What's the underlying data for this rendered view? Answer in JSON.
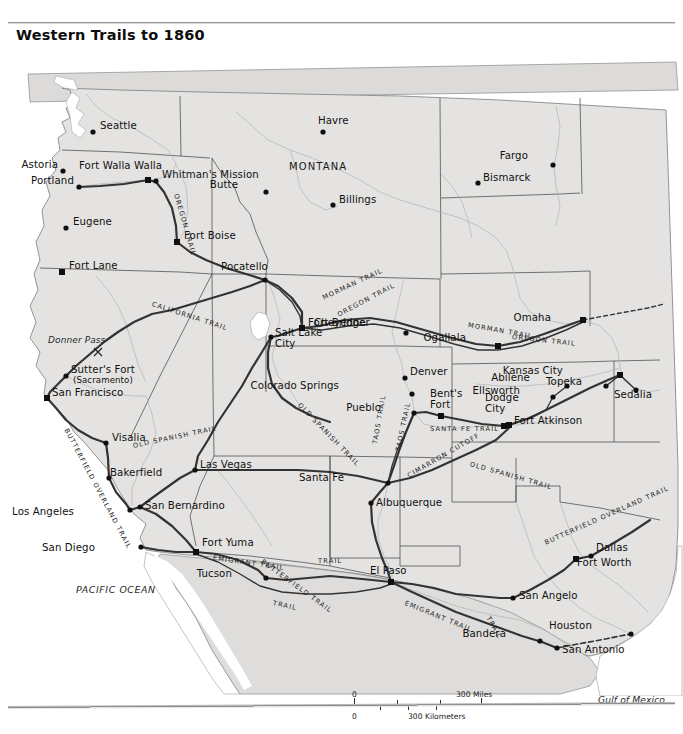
{
  "page": {
    "ghost_header": "",
    "title": "Western Trails to 1860"
  },
  "map": {
    "state_labels": [
      {
        "name": "MONTANA",
        "x": 289,
        "y": 122
      }
    ],
    "water_labels": [
      {
        "name": "PACIFIC OCEAN",
        "x": 76,
        "y": 545
      },
      {
        "name": "Gulf of Mexico",
        "x": 598,
        "y": 655
      }
    ],
    "feature_labels": [
      {
        "name": "Donner Pass",
        "x": 48,
        "y": 296
      }
    ],
    "cities": [
      {
        "name": "Seattle",
        "x": 93,
        "y": 86,
        "lx": 100,
        "ly": 81,
        "marker": "dot",
        "anchor": "left"
      },
      {
        "name": "Astoria",
        "x": 63,
        "y": 125,
        "lx": 58,
        "ly": 120,
        "marker": "dot",
        "anchor": "right"
      },
      {
        "name": "Portland",
        "x": 79,
        "y": 141,
        "lx": 74,
        "ly": 136,
        "marker": "dot",
        "anchor": "right"
      },
      {
        "name": "Fort Walla Walla",
        "x": 148,
        "y": 134,
        "lx": 79,
        "ly": 121,
        "marker": "square",
        "anchor": "left"
      },
      {
        "name": "Whitman's Mission",
        "x": 156,
        "y": 135,
        "lx": 162,
        "ly": 130,
        "marker": "dot",
        "anchor": "left"
      },
      {
        "name": "Eugene",
        "x": 66,
        "y": 182,
        "lx": 73,
        "ly": 177,
        "marker": "dot",
        "anchor": "left"
      },
      {
        "name": "Fort Boise",
        "x": 177,
        "y": 196,
        "lx": 184,
        "ly": 191,
        "marker": "square",
        "anchor": "left"
      },
      {
        "name": "Fort Lane",
        "x": 62,
        "y": 226,
        "lx": 69,
        "ly": 221,
        "marker": "square",
        "anchor": "left"
      },
      {
        "name": "Pocatello",
        "x": 265,
        "y": 234,
        "lx": 221,
        "ly": 222,
        "marker": "dot",
        "anchor": "left"
      },
      {
        "name": "Butte",
        "x": 266,
        "y": 146,
        "lx": 238,
        "ly": 140,
        "marker": "dot",
        "anchor": "right"
      },
      {
        "name": "Havre",
        "x": 323,
        "y": 86,
        "lx": 318,
        "ly": 76,
        "marker": "dot",
        "anchor": "left"
      },
      {
        "name": "Billings",
        "x": 333,
        "y": 159,
        "lx": 339,
        "ly": 155,
        "marker": "dot",
        "anchor": "left"
      },
      {
        "name": "Bismarck",
        "x": 478,
        "y": 137,
        "lx": 483,
        "ly": 133,
        "marker": "dot",
        "anchor": "left"
      },
      {
        "name": "Fargo",
        "x": 553,
        "y": 119,
        "lx": 528,
        "ly": 111,
        "marker": "dot",
        "anchor": "right"
      },
      {
        "name": "Salt Lake City",
        "x": 271,
        "y": 291,
        "lx": 275,
        "ly": 288,
        "marker": "dot",
        "anchor": "left"
      },
      {
        "name": "Fort Bridger",
        "x": 302,
        "y": 282,
        "lx": 308,
        "ly": 278,
        "marker": "square",
        "anchor": "left"
      },
      {
        "name": "Cheyenne",
        "x": 406,
        "y": 287,
        "lx": 366,
        "ly": 278,
        "marker": "dot",
        "anchor": "right"
      },
      {
        "name": "Ogallala",
        "x": 498,
        "y": 300,
        "lx": 466,
        "ly": 293,
        "marker": "square",
        "anchor": "right"
      },
      {
        "name": "Omaha",
        "x": 583,
        "y": 274,
        "lx": 551,
        "ly": 273,
        "marker": "square",
        "anchor": "right"
      },
      {
        "name": "Denver",
        "x": 405,
        "y": 332,
        "lx": 410,
        "ly": 327,
        "marker": "dot",
        "anchor": "left"
      },
      {
        "name": "Colorado Springs",
        "x": 412,
        "y": 348,
        "lx": 339,
        "ly": 341,
        "marker": "dot",
        "anchor": "right"
      },
      {
        "name": "Pueblo",
        "x": 414,
        "y": 367,
        "lx": 381,
        "ly": 363,
        "marker": "dot",
        "anchor": "right"
      },
      {
        "name": "Bent's Fort",
        "x": 441,
        "y": 370,
        "lx": 430,
        "ly": 349,
        "marker": "square",
        "anchor": "left"
      },
      {
        "name": "Dodge City",
        "x": 504,
        "y": 380,
        "lx": 485,
        "ly": 353,
        "marker": "square",
        "anchor": "left"
      },
      {
        "name": "Fort Atkinson",
        "x": 509,
        "y": 379,
        "lx": 514,
        "ly": 376,
        "marker": "square",
        "anchor": "left"
      },
      {
        "name": "Ellsworth",
        "x": 553,
        "y": 351,
        "lx": 520,
        "ly": 346,
        "marker": "dot",
        "anchor": "right"
      },
      {
        "name": "Abilene",
        "x": 567,
        "y": 340,
        "lx": 530,
        "ly": 333,
        "marker": "dot",
        "anchor": "right"
      },
      {
        "name": "Kansas City",
        "x": 620,
        "y": 329,
        "lx": 563,
        "ly": 326,
        "marker": "square",
        "anchor": "right"
      },
      {
        "name": "Topeka",
        "x": 606,
        "y": 340,
        "lx": 582,
        "ly": 337,
        "marker": "dot",
        "anchor": "right"
      },
      {
        "name": "Sedalia",
        "x": 636,
        "y": 344,
        "lx": 614,
        "ly": 350,
        "marker": "dot",
        "anchor": "left"
      },
      {
        "name": "Sutter's Fort",
        "x": 66,
        "y": 330,
        "lx": 71,
        "ly": 325,
        "marker": "dot",
        "anchor": "left"
      },
      {
        "name": "(Sacramento)",
        "x": 0,
        "y": 0,
        "lx": 73,
        "ly": 336,
        "marker": "none",
        "anchor": "left"
      },
      {
        "name": "San Francisco",
        "x": 47,
        "y": 352,
        "lx": 52,
        "ly": 348,
        "marker": "square",
        "anchor": "left"
      },
      {
        "name": "Visalia",
        "x": 106,
        "y": 397,
        "lx": 112,
        "ly": 393,
        "marker": "dot",
        "anchor": "left"
      },
      {
        "name": "Bakerfield",
        "x": 109,
        "y": 432,
        "lx": 110,
        "ly": 428,
        "marker": "dot",
        "anchor": "left"
      },
      {
        "name": "Los Angeles",
        "x": 130,
        "y": 464,
        "lx": 74,
        "ly": 467,
        "marker": "dot",
        "anchor": "right"
      },
      {
        "name": "San Bernardino",
        "x": 140,
        "y": 461,
        "lx": 145,
        "ly": 461,
        "marker": "dot",
        "anchor": "left"
      },
      {
        "name": "San Diego",
        "x": 141,
        "y": 501,
        "lx": 95,
        "ly": 503,
        "marker": "dot",
        "anchor": "right"
      },
      {
        "name": "Las Vegas",
        "x": 195,
        "y": 424,
        "lx": 200,
        "ly": 420,
        "marker": "dot",
        "anchor": "left"
      },
      {
        "name": "Fort Yuma",
        "x": 196,
        "y": 506,
        "lx": 202,
        "ly": 498,
        "marker": "square",
        "anchor": "left"
      },
      {
        "name": "Tucson",
        "x": 266,
        "y": 532,
        "lx": 232,
        "ly": 529,
        "marker": "dot",
        "anchor": "right"
      },
      {
        "name": "Santa Fe",
        "x": 388,
        "y": 437,
        "lx": 344,
        "ly": 433,
        "marker": "dot",
        "anchor": "right"
      },
      {
        "name": "Albuquerque",
        "x": 371,
        "y": 457,
        "lx": 376,
        "ly": 458,
        "marker": "dot",
        "anchor": "left"
      },
      {
        "name": "El Paso",
        "x": 391,
        "y": 536,
        "lx": 370,
        "ly": 526,
        "marker": "square",
        "anchor": "left"
      },
      {
        "name": "Dallas",
        "x": 591,
        "y": 510,
        "lx": 596,
        "ly": 503,
        "marker": "dot",
        "anchor": "left"
      },
      {
        "name": "Fort Worth",
        "x": 576,
        "y": 513,
        "lx": 577,
        "ly": 518,
        "marker": "square",
        "anchor": "left"
      },
      {
        "name": "San Angelo",
        "x": 513,
        "y": 552,
        "lx": 519,
        "ly": 551,
        "marker": "dot",
        "anchor": "left"
      },
      {
        "name": "Bandera",
        "x": 540,
        "y": 595,
        "lx": 506,
        "ly": 589,
        "marker": "dot",
        "anchor": "right"
      },
      {
        "name": "San Antonio",
        "x": 557,
        "y": 602,
        "lx": 562,
        "ly": 605,
        "marker": "dot",
        "anchor": "left"
      },
      {
        "name": "Houston",
        "x": 631,
        "y": 588,
        "lx": 592,
        "ly": 581,
        "marker": "dot",
        "anchor": "right"
      }
    ],
    "trail_labels": [
      {
        "name": "OREGON TRAIL",
        "x": 176,
        "y": 148,
        "rot": 74,
        "size": "sm"
      },
      {
        "name": "CALIFORNIA TRAIL",
        "x": 152,
        "y": 258,
        "rot": 18,
        "size": "sm"
      },
      {
        "name": "MORMAN TRAIL",
        "x": 323,
        "y": 252,
        "rot": -25,
        "size": "sm"
      },
      {
        "name": "OREGON TRAIL",
        "x": 338,
        "y": 269,
        "rot": -28,
        "size": "sm"
      },
      {
        "name": "MORMAN TRAIL",
        "x": 468,
        "y": 279,
        "rot": 10,
        "size": "sm"
      },
      {
        "name": "OREGON TRAIL",
        "x": 512,
        "y": 291,
        "rot": 6,
        "size": "sm"
      },
      {
        "name": "OLD SPANISH TRAIL",
        "x": 299,
        "y": 358,
        "rot": 46,
        "size": "sm"
      },
      {
        "name": "OLD SPANISH TRAIL",
        "x": 133,
        "y": 400,
        "rot": -12,
        "size": "sm"
      },
      {
        "name": "OLD SPANISH TRAIL",
        "x": 470,
        "y": 418,
        "rot": 16,
        "size": "sm"
      },
      {
        "name": "SANTA FE TRAIL",
        "x": 430,
        "y": 383,
        "rot": 0,
        "size": "sm"
      },
      {
        "name": "CIMARRON CUTOFF",
        "x": 408,
        "y": 430,
        "rot": -30,
        "size": "sm"
      },
      {
        "name": "TAOS TRAIL",
        "x": 398,
        "y": 405,
        "rot": -78,
        "size": "sm"
      },
      {
        "name": "TAOS TRAIL",
        "x": 375,
        "y": 398,
        "rot": -80,
        "size": "sm"
      },
      {
        "name": "BUTTERFIELD OVERLAND TRAIL",
        "x": 66,
        "y": 383,
        "rot": 62,
        "size": "sm"
      },
      {
        "name": "EMIGRANT TRAIL",
        "x": 213,
        "y": 512,
        "rot": 8,
        "size": "sm"
      },
      {
        "name": "BUTTERFIELD TRAIL",
        "x": 262,
        "y": 515,
        "rot": 36,
        "size": "sm"
      },
      {
        "name": "TRAIL",
        "x": 318,
        "y": 515,
        "rot": 0,
        "size": "sm"
      },
      {
        "name": "TRAIL",
        "x": 273,
        "y": 557,
        "rot": 12,
        "size": "sm"
      },
      {
        "name": "EMIGRANT TRAIL",
        "x": 405,
        "y": 557,
        "rot": 22,
        "size": "sm"
      },
      {
        "name": "BUTTERFIELD OVERLAND TRAIL",
        "x": 545,
        "y": 497,
        "rot": -24,
        "size": "sm"
      },
      {
        "name": "TRAIL",
        "x": 488,
        "y": 571,
        "rot": 60,
        "size": "sm"
      }
    ]
  },
  "scalebar": {
    "miles_zero": "0",
    "miles_max": "300 Miles",
    "km_zero": "0",
    "km_max": "300 Kilometers"
  },
  "colors": {
    "land": "#e4e3e1",
    "land_alt": "#dedddb",
    "water": "#ffffff",
    "border": "#6f6f6f",
    "state_border": "#3a3a3a",
    "river": "#b9b9b9",
    "trail": "#3b3b3b",
    "text": "#111111"
  }
}
